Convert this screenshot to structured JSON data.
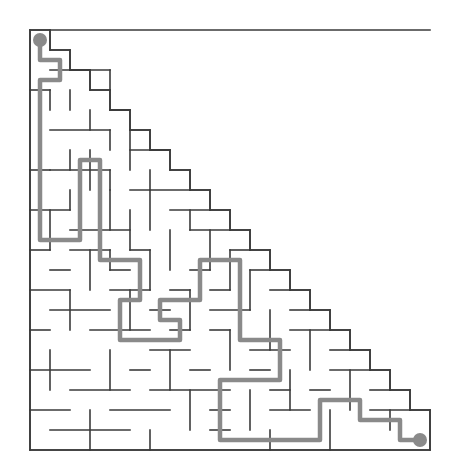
{
  "figure": {
    "kind": "maze-puzzle",
    "shape": "right-triangle",
    "title": "",
    "background_color": "#ffffff",
    "wall_color": "#3a3a3a",
    "wall_width": 1.6,
    "solution_color": "#8a8a8a",
    "solution_width": 4.5,
    "marker_color": "#8a8a8a",
    "marker_radius": 7
  },
  "grid": {
    "origin_x": 30,
    "origin_y": 30,
    "cell": 20,
    "cols": 20,
    "rows": 21,
    "width_px": 400,
    "height_px": 420
  },
  "markers": {
    "start": {
      "label": "start",
      "x": 40,
      "y": 40
    },
    "end": {
      "label": "end",
      "x": 420,
      "y": 440
    }
  },
  "outline": [
    [
      30,
      30
    ],
    [
      50,
      30
    ],
    [
      50,
      50
    ],
    [
      70,
      50
    ],
    [
      70,
      70
    ],
    [
      90,
      70
    ],
    [
      90,
      90
    ],
    [
      110,
      90
    ],
    [
      110,
      110
    ],
    [
      130,
      110
    ],
    [
      130,
      130
    ],
    [
      150,
      130
    ],
    [
      150,
      150
    ],
    [
      170,
      150
    ],
    [
      170,
      170
    ],
    [
      190,
      170
    ],
    [
      190,
      190
    ],
    [
      210,
      190
    ],
    [
      210,
      210
    ],
    [
      230,
      210
    ],
    [
      230,
      230
    ],
    [
      250,
      230
    ],
    [
      250,
      250
    ],
    [
      270,
      250
    ],
    [
      270,
      270
    ],
    [
      290,
      270
    ],
    [
      290,
      290
    ],
    [
      310,
      290
    ],
    [
      310,
      310
    ],
    [
      330,
      310
    ],
    [
      330,
      330
    ],
    [
      350,
      330
    ],
    [
      350,
      350
    ],
    [
      370,
      350
    ],
    [
      370,
      370
    ],
    [
      390,
      370
    ],
    [
      390,
      390
    ],
    [
      410,
      390
    ],
    [
      410,
      410
    ],
    [
      430,
      410
    ],
    [
      430,
      450
    ],
    [
      30,
      450
    ],
    [
      30,
      30
    ]
  ],
  "walls": [
    [
      50,
      50,
      70,
      50
    ],
    [
      70,
      70,
      90,
      70
    ],
    [
      90,
      90,
      110,
      90
    ],
    [
      110,
      110,
      130,
      110
    ],
    [
      130,
      130,
      150,
      130
    ],
    [
      150,
      150,
      170,
      150
    ],
    [
      170,
      170,
      190,
      170
    ],
    [
      190,
      190,
      210,
      190
    ],
    [
      210,
      210,
      230,
      210
    ],
    [
      230,
      230,
      250,
      230
    ],
    [
      250,
      250,
      270,
      250
    ],
    [
      270,
      270,
      290,
      270
    ],
    [
      290,
      290,
      310,
      290
    ],
    [
      310,
      310,
      330,
      310
    ],
    [
      330,
      330,
      350,
      330
    ],
    [
      350,
      350,
      370,
      350
    ],
    [
      370,
      370,
      390,
      370
    ],
    [
      390,
      390,
      410,
      390
    ],
    [
      410,
      410,
      430,
      410
    ],
    [
      50,
      30,
      50,
      50
    ],
    [
      70,
      50,
      70,
      70
    ],
    [
      90,
      70,
      90,
      90
    ],
    [
      110,
      90,
      110,
      110
    ],
    [
      130,
      110,
      130,
      130
    ],
    [
      150,
      130,
      150,
      150
    ],
    [
      170,
      150,
      170,
      170
    ],
    [
      190,
      170,
      190,
      190
    ],
    [
      210,
      190,
      210,
      210
    ],
    [
      230,
      210,
      230,
      230
    ],
    [
      250,
      230,
      250,
      250
    ],
    [
      270,
      250,
      270,
      270
    ],
    [
      290,
      270,
      290,
      290
    ],
    [
      310,
      290,
      310,
      310
    ],
    [
      330,
      310,
      330,
      330
    ],
    [
      350,
      330,
      350,
      350
    ],
    [
      370,
      350,
      370,
      370
    ],
    [
      390,
      370,
      390,
      390
    ],
    [
      410,
      390,
      410,
      410
    ],
    [
      430,
      410,
      430,
      450
    ],
    [
      30,
      30,
      430,
      30
    ],
    [
      30,
      450,
      430,
      450
    ],
    [
      30,
      30,
      30,
      450
    ],
    [
      50,
      70,
      110,
      70
    ],
    [
      70,
      90,
      70,
      110
    ],
    [
      110,
      70,
      110,
      90
    ],
    [
      30,
      90,
      50,
      90
    ],
    [
      50,
      90,
      50,
      110
    ],
    [
      90,
      110,
      90,
      130
    ],
    [
      110,
      110,
      130,
      110
    ],
    [
      50,
      130,
      110,
      130
    ],
    [
      110,
      130,
      110,
      150
    ],
    [
      130,
      130,
      130,
      170
    ],
    [
      130,
      150,
      170,
      150
    ],
    [
      30,
      170,
      50,
      170
    ],
    [
      70,
      150,
      70,
      170
    ],
    [
      90,
      150,
      90,
      190
    ],
    [
      50,
      170,
      110,
      170
    ],
    [
      110,
      170,
      110,
      190
    ],
    [
      150,
      170,
      150,
      190
    ],
    [
      130,
      190,
      190,
      190
    ],
    [
      70,
      190,
      70,
      210
    ],
    [
      30,
      210,
      70,
      210
    ],
    [
      110,
      190,
      110,
      230
    ],
    [
      150,
      190,
      150,
      230
    ],
    [
      170,
      210,
      210,
      210
    ],
    [
      190,
      210,
      190,
      230
    ],
    [
      50,
      210,
      50,
      250
    ],
    [
      70,
      230,
      130,
      230
    ],
    [
      130,
      210,
      130,
      250
    ],
    [
      170,
      230,
      170,
      270
    ],
    [
      190,
      230,
      230,
      230
    ],
    [
      210,
      230,
      210,
      270
    ],
    [
      30,
      250,
      50,
      250
    ],
    [
      70,
      250,
      110,
      250
    ],
    [
      90,
      250,
      90,
      290
    ],
    [
      110,
      250,
      110,
      270
    ],
    [
      130,
      250,
      150,
      250
    ],
    [
      150,
      250,
      150,
      290
    ],
    [
      230,
      250,
      250,
      250
    ],
    [
      230,
      250,
      230,
      290
    ],
    [
      50,
      270,
      70,
      270
    ],
    [
      110,
      270,
      130,
      270
    ],
    [
      190,
      270,
      210,
      270
    ],
    [
      250,
      270,
      270,
      270
    ],
    [
      250,
      270,
      250,
      310
    ],
    [
      30,
      290,
      70,
      290
    ],
    [
      110,
      290,
      150,
      290
    ],
    [
      170,
      290,
      190,
      290
    ],
    [
      190,
      290,
      190,
      330
    ],
    [
      210,
      290,
      230,
      290
    ],
    [
      270,
      290,
      290,
      290
    ],
    [
      70,
      290,
      70,
      330
    ],
    [
      130,
      290,
      130,
      330
    ],
    [
      50,
      310,
      110,
      310
    ],
    [
      150,
      310,
      170,
      310
    ],
    [
      210,
      310,
      250,
      310
    ],
    [
      270,
      310,
      270,
      350
    ],
    [
      290,
      310,
      310,
      310
    ],
    [
      30,
      330,
      50,
      330
    ],
    [
      90,
      330,
      150,
      330
    ],
    [
      170,
      330,
      190,
      330
    ],
    [
      210,
      330,
      230,
      330
    ],
    [
      230,
      330,
      230,
      370
    ],
    [
      290,
      330,
      330,
      330
    ],
    [
      310,
      330,
      310,
      370
    ],
    [
      50,
      350,
      50,
      390
    ],
    [
      110,
      350,
      110,
      390
    ],
    [
      150,
      350,
      190,
      350
    ],
    [
      170,
      350,
      170,
      390
    ],
    [
      250,
      350,
      290,
      350
    ],
    [
      330,
      350,
      350,
      350
    ],
    [
      30,
      370,
      90,
      370
    ],
    [
      130,
      370,
      150,
      370
    ],
    [
      190,
      370,
      210,
      370
    ],
    [
      250,
      370,
      270,
      370
    ],
    [
      290,
      370,
      290,
      410
    ],
    [
      330,
      370,
      370,
      370
    ],
    [
      350,
      370,
      350,
      410
    ],
    [
      70,
      390,
      130,
      390
    ],
    [
      150,
      390,
      230,
      390
    ],
    [
      190,
      390,
      190,
      430
    ],
    [
      250,
      390,
      250,
      430
    ],
    [
      270,
      390,
      290,
      390
    ],
    [
      310,
      390,
      330,
      390
    ],
    [
      370,
      390,
      390,
      390
    ],
    [
      30,
      410,
      70,
      410
    ],
    [
      90,
      410,
      90,
      450
    ],
    [
      110,
      410,
      170,
      410
    ],
    [
      210,
      410,
      230,
      410
    ],
    [
      270,
      410,
      310,
      410
    ],
    [
      330,
      410,
      330,
      450
    ],
    [
      370,
      410,
      410,
      410
    ],
    [
      150,
      430,
      150,
      450
    ],
    [
      270,
      430,
      270,
      450
    ],
    [
      390,
      410,
      390,
      430
    ],
    [
      50,
      430,
      130,
      430
    ],
    [
      210,
      430,
      230,
      430
    ]
  ],
  "solution_path": [
    [
      40,
      40
    ],
    [
      40,
      60
    ],
    [
      60,
      60
    ],
    [
      60,
      80
    ],
    [
      40,
      80
    ],
    [
      40,
      100
    ],
    [
      40,
      120
    ],
    [
      40,
      140
    ],
    [
      40,
      160
    ],
    [
      40,
      180
    ],
    [
      40,
      200
    ],
    [
      40,
      220
    ],
    [
      40,
      240
    ],
    [
      60,
      240
    ],
    [
      80,
      240
    ],
    [
      80,
      220
    ],
    [
      80,
      200
    ],
    [
      80,
      180
    ],
    [
      80,
      160
    ],
    [
      100,
      160
    ],
    [
      100,
      180
    ],
    [
      100,
      200
    ],
    [
      100,
      220
    ],
    [
      100,
      240
    ],
    [
      100,
      260
    ],
    [
      120,
      260
    ],
    [
      140,
      260
    ],
    [
      140,
      280
    ],
    [
      140,
      300
    ],
    [
      120,
      300
    ],
    [
      120,
      320
    ],
    [
      120,
      340
    ],
    [
      140,
      340
    ],
    [
      160,
      340
    ],
    [
      180,
      340
    ],
    [
      180,
      320
    ],
    [
      160,
      320
    ],
    [
      160,
      300
    ],
    [
      180,
      300
    ],
    [
      200,
      300
    ],
    [
      200,
      280
    ],
    [
      200,
      260
    ],
    [
      220,
      260
    ],
    [
      240,
      260
    ],
    [
      240,
      280
    ],
    [
      240,
      300
    ],
    [
      240,
      320
    ],
    [
      240,
      340
    ],
    [
      260,
      340
    ],
    [
      280,
      340
    ],
    [
      280,
      360
    ],
    [
      280,
      380
    ],
    [
      260,
      380
    ],
    [
      240,
      380
    ],
    [
      220,
      380
    ],
    [
      220,
      400
    ],
    [
      220,
      420
    ],
    [
      220,
      440
    ],
    [
      240,
      440
    ],
    [
      260,
      440
    ],
    [
      280,
      440
    ],
    [
      300,
      440
    ],
    [
      320,
      440
    ],
    [
      320,
      420
    ],
    [
      320,
      400
    ],
    [
      340,
      400
    ],
    [
      360,
      400
    ],
    [
      360,
      420
    ],
    [
      380,
      420
    ],
    [
      400,
      420
    ],
    [
      400,
      440
    ],
    [
      420,
      440
    ]
  ]
}
